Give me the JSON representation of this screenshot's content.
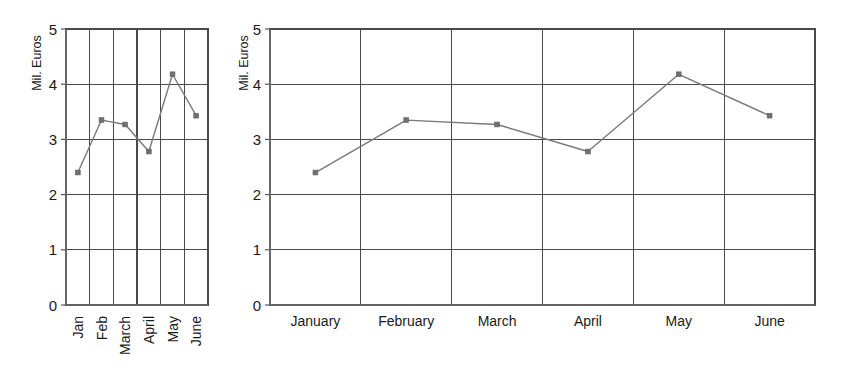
{
  "figure": {
    "panels": [
      {
        "id": "narrow",
        "name": "line-chart-narrow",
        "ylabel": "Mil. Euros",
        "xlabel_style": "rotated-abbreviated",
        "categories": [
          "Jan",
          "Feb",
          "March",
          "April",
          "May",
          "June"
        ],
        "ytick_labels": [
          "0",
          "1",
          "2",
          "3",
          "4",
          "5"
        ]
      },
      {
        "id": "wide",
        "name": "line-chart-wide",
        "ylabel": "Mil. Euros",
        "xlabel_style": "horizontal-full",
        "categories": [
          "January",
          "February",
          "March",
          "April",
          "May",
          "June"
        ],
        "ytick_labels": [
          "0",
          "1",
          "2",
          "3",
          "4",
          "5"
        ]
      }
    ]
  },
  "chart_data": [
    {
      "type": "line",
      "title": "",
      "subtitle": "",
      "xlabel": "",
      "ylabel": "Mil. Euros",
      "categories": [
        "Jan",
        "Feb",
        "March",
        "April",
        "May",
        "June"
      ],
      "values": [
        2.4,
        3.35,
        3.27,
        2.78,
        4.18,
        3.43
      ],
      "ylim": [
        0,
        5
      ],
      "yticks": [
        0,
        1,
        2,
        3,
        4,
        5
      ],
      "grid": "both",
      "legend": "none",
      "line_color": "#7a7a7a",
      "marker_color": "#707070",
      "markers": true
    },
    {
      "type": "line",
      "title": "",
      "subtitle": "",
      "xlabel": "",
      "ylabel": "Mil. Euros",
      "categories": [
        "January",
        "February",
        "March",
        "April",
        "May",
        "June"
      ],
      "values": [
        2.4,
        3.35,
        3.27,
        2.78,
        4.18,
        3.43
      ],
      "ylim": [
        0,
        5
      ],
      "yticks": [
        0,
        1,
        2,
        3,
        4,
        5
      ],
      "grid": "both",
      "legend": "none",
      "line_color": "#7a7a7a",
      "marker_color": "#707070",
      "markers": true
    }
  ],
  "colors": {
    "background": "#ffffff",
    "axis": "#6e6e6e",
    "grid": "#4a4a4a",
    "series": "#7a7a7a",
    "marker": "#707070",
    "text": "#1a1a1a"
  }
}
